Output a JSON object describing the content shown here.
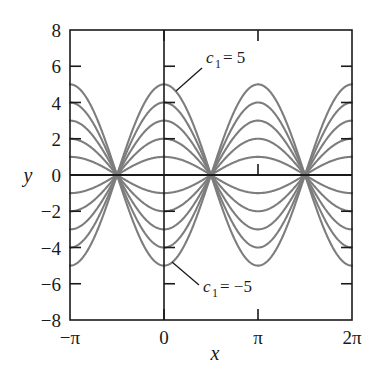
{
  "chart_data": {
    "type": "line",
    "title": "",
    "xlabel": "x",
    "ylabel": "y",
    "xlim": [
      -3.141592653589793,
      6.283185307179586
    ],
    "ylim": [
      -8,
      8
    ],
    "grid": false,
    "legend": "none",
    "x_tick_labels": [
      "−π",
      "0",
      "π",
      "2π"
    ],
    "x_tick_values": [
      -3.141592653589793,
      0,
      3.141592653589793,
      6.283185307179586
    ],
    "y_tick_labels": [
      "8",
      "6",
      "4",
      "2",
      "0",
      "−2",
      "−4",
      "−6",
      "−8"
    ],
    "y_tick_values": [
      8,
      6,
      4,
      2,
      0,
      -2,
      -4,
      -6,
      -8
    ],
    "function": "y = c1 * cos(x)",
    "series": [
      {
        "name": "c1 = 5",
        "c1": 5,
        "values_at_x_0": 5
      },
      {
        "name": "c1 = 4",
        "c1": 4,
        "values_at_x_0": 4
      },
      {
        "name": "c1 = 3",
        "c1": 3,
        "values_at_x_0": 3
      },
      {
        "name": "c1 = 2",
        "c1": 2,
        "values_at_x_0": 2
      },
      {
        "name": "c1 = 1",
        "c1": 1,
        "values_at_x_0": 1
      },
      {
        "name": "c1 = 0",
        "c1": 0,
        "values_at_x_0": 0
      },
      {
        "name": "c1 = -1",
        "c1": -1,
        "values_at_x_0": -1
      },
      {
        "name": "c1 = -2",
        "c1": -2,
        "values_at_x_0": -2
      },
      {
        "name": "c1 = -3",
        "c1": -3,
        "values_at_x_0": -3
      },
      {
        "name": "c1 = -4",
        "c1": -4,
        "values_at_x_0": -4
      },
      {
        "name": "c1 = -5",
        "c1": -5,
        "values_at_x_0": -5
      }
    ],
    "annotations": [
      {
        "id": "upper",
        "c_symbol": "c",
        "subscript": "1",
        "equals": "= 5",
        "target_x": 0,
        "target_y": 5
      },
      {
        "id": "lower",
        "c_symbol": "c",
        "subscript": "1",
        "equals": "= −5",
        "target_x": 0,
        "target_y": -5
      }
    ],
    "colors": {
      "curve": "#7d7d7d",
      "axis": "#1a1a1a",
      "text": "#1a1a1a",
      "background": "#ffffff"
    }
  }
}
